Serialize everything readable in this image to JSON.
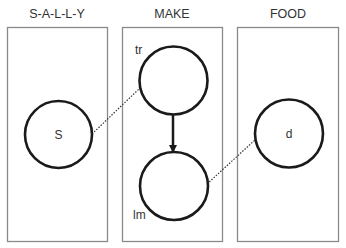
{
  "diagram": {
    "type": "graphical-model-plates",
    "plates": [
      {
        "id": "sally",
        "title": "S-A-L-L-Y"
      },
      {
        "id": "make",
        "title": "MAKE"
      },
      {
        "id": "food",
        "title": "FOOD"
      }
    ],
    "nodes": [
      {
        "id": "s",
        "label": "S",
        "plate": "sally"
      },
      {
        "id": "tr",
        "label": "tr",
        "plate": "make"
      },
      {
        "id": "lm",
        "label": "lm",
        "plate": "make"
      },
      {
        "id": "d",
        "label": "d",
        "plate": "food"
      }
    ],
    "edges": [
      {
        "from": "s",
        "to": "tr",
        "style": "dotted"
      },
      {
        "from": "tr",
        "to": "lm",
        "style": "solid-arrow"
      },
      {
        "from": "lm",
        "to": "d",
        "style": "dotted"
      }
    ],
    "colors": {
      "plate_border": "#8a8a8a",
      "node_stroke": "#1a1a1a",
      "text": "#333333"
    }
  }
}
